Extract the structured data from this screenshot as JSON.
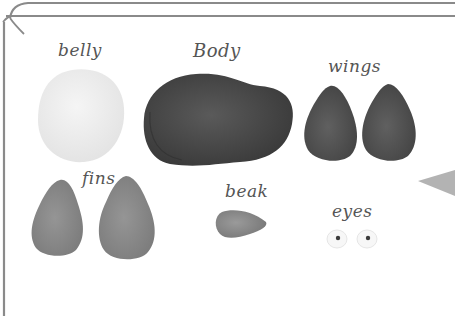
{
  "labels": {
    "belly": "belly",
    "body": "Body",
    "wings": "wings",
    "fins": "fins",
    "beak": "beak",
    "eyes": "eyes"
  },
  "colors": {
    "frame_line": "#8a8a8a",
    "belly": "#efefef",
    "body": "#4a4a4a",
    "wings": "#555555",
    "fins": "#8c8c8c",
    "beak": "#8a8a8a",
    "eye_white": "#f7f7f7",
    "pupil": "#3a3a3a",
    "label_text": "#555555",
    "corner_triangle": "#b3b3b3"
  }
}
